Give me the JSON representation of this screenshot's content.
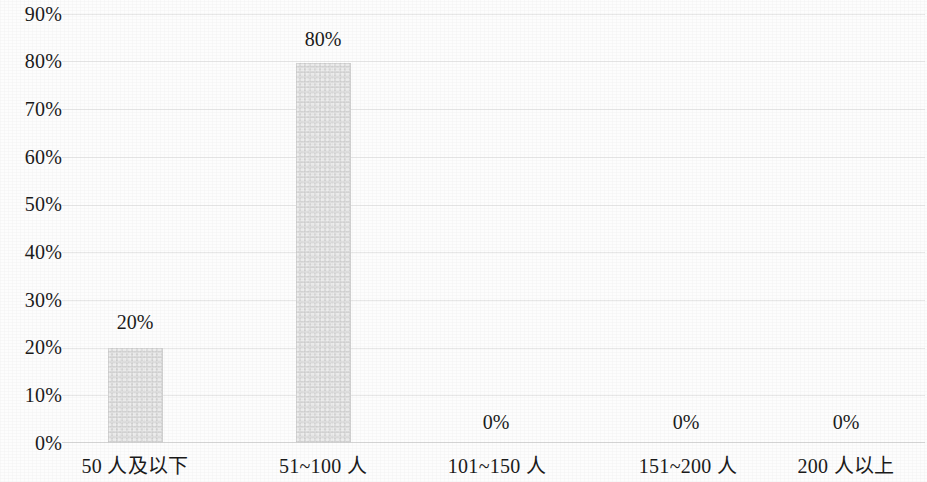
{
  "chart_data": {
    "type": "bar",
    "title": "",
    "subtitle": "",
    "xlabel": "",
    "ylabel": "",
    "categories": [
      "50 人及以下",
      "51~100 人",
      "101~150 人",
      "151~200 人",
      "200 人以上"
    ],
    "values": [
      20,
      80,
      0,
      0,
      0
    ],
    "value_labels": [
      "20%",
      "80%",
      "0%",
      "0%",
      "0%"
    ],
    "ylim": [
      0,
      90
    ],
    "ytick_values": [
      0,
      10,
      20,
      30,
      40,
      50,
      60,
      70,
      80,
      90
    ],
    "ytick_labels": [
      "0%",
      "10%",
      "20%",
      "30%",
      "40%",
      "50%",
      "60%",
      "70%",
      "80%",
      "90%"
    ],
    "grid": true,
    "grid_axis": "y",
    "legend": false,
    "legend_position": "none",
    "series": [
      {
        "name": "占比",
        "values": [
          20,
          80,
          0,
          0,
          0
        ],
        "color": "#d6d6d6"
      }
    ],
    "colors": {
      "bar_fill": "#d6d6d6",
      "gridline": "#e8e8e8",
      "baseline": "#d8d8d8",
      "text": "#1b1b1b",
      "background": "#fdfdfd"
    }
  }
}
